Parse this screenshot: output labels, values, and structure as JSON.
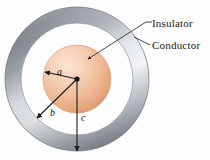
{
  "figure": {
    "background_color": "#fdfdfd"
  },
  "callouts": [
    {
      "id": "insulator",
      "label": "Insulator",
      "target": "inner-sphere"
    },
    {
      "id": "conductor",
      "label": "Conductor",
      "target": "outer-ring"
    }
  ],
  "radii": [
    {
      "id": "a",
      "label": "a",
      "description": "radius of inner sphere"
    },
    {
      "id": "b",
      "label": "b",
      "description": "inner radius of conducting shell"
    },
    {
      "id": "c",
      "label": "c",
      "description": "outer radius of conducting shell"
    }
  ],
  "geometry": {
    "center_x": 77,
    "center_y": 79,
    "radius_a": 34,
    "radius_b": 56,
    "radius_c": 72
  },
  "colors": {
    "sphere_light": "#f7d9c4",
    "sphere_mid": "#efb894",
    "sphere_dark": "#d98f66",
    "ring_light": "#f2f4f7",
    "ring_mid": "#b9bfc8",
    "ring_dark": "#6f747c",
    "ring_shadow": "#53585f",
    "line": "#1a1a1a",
    "gap": "#ffffff"
  }
}
